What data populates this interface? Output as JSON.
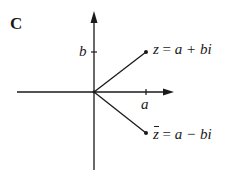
{
  "figure": {
    "panel_label": "C",
    "axes": {
      "horizontal": {
        "x1": 17,
        "x2": 173,
        "y": 92,
        "arrow": "right"
      },
      "vertical": {
        "x": 94,
        "y1": 12,
        "y2": 170,
        "arrow": "up"
      },
      "origin": {
        "x": 94,
        "y": 92
      }
    },
    "ticks": {
      "b": {
        "label": "b",
        "x": 94,
        "y": 52
      },
      "a": {
        "label": "a",
        "x": 146,
        "y": 92
      }
    },
    "points": [
      {
        "name": "z",
        "x": 146,
        "y": 52,
        "label_lhs": "z",
        "label_eq": " = ",
        "label_rhs": "a + bi"
      },
      {
        "name": "z-conjugate",
        "x": 146,
        "y": 133,
        "label_lhs": "z",
        "label_eq": " = ",
        "label_rhs": "a − bi"
      }
    ],
    "colors": {
      "ink": "#1a1a1a",
      "background": "#ffffff"
    }
  }
}
